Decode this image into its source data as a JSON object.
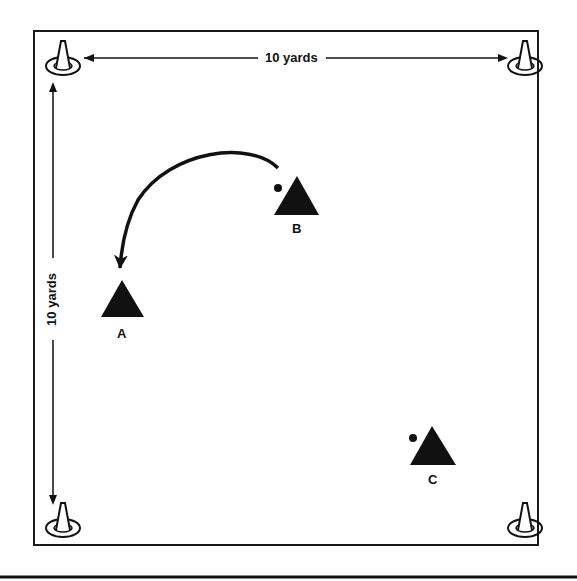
{
  "diagram": {
    "field": {
      "width_label": "10 yards",
      "height_label": "10 yards",
      "border_color": "#1a1a1a",
      "background": "#ffffff"
    },
    "cones": [
      {
        "position": "top-left"
      },
      {
        "position": "top-right"
      },
      {
        "position": "bottom-left"
      },
      {
        "position": "bottom-right"
      }
    ],
    "players": [
      {
        "id": "A",
        "label": "A",
        "has_ball": false
      },
      {
        "id": "B",
        "label": "B",
        "has_ball": true
      },
      {
        "id": "C",
        "label": "C",
        "has_ball": true
      }
    ],
    "pass": {
      "from": "B",
      "to": "A",
      "style": "curved-arrow"
    },
    "colors": {
      "ink": "#111111"
    }
  }
}
